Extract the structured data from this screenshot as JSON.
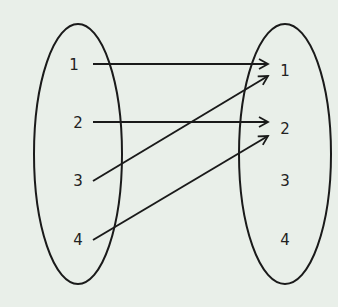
{
  "diagram": {
    "type": "mapping",
    "background": "#e9efe9",
    "stroke": "#1a1a1a",
    "domain": {
      "label_items": [
        "1",
        "2",
        "3",
        "4"
      ]
    },
    "codomain": {
      "label_items": [
        "1",
        "2",
        "3",
        "4"
      ]
    },
    "mappings": [
      {
        "from": "1",
        "to": "1"
      },
      {
        "from": "2",
        "to": "2"
      },
      {
        "from": "3",
        "to": "1"
      },
      {
        "from": "4",
        "to": "2"
      }
    ]
  }
}
